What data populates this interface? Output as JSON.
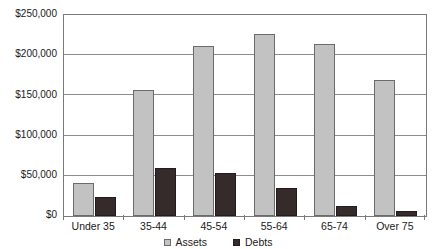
{
  "chart_data": {
    "type": "bar",
    "title": "",
    "subtitle": "",
    "xlabel": "",
    "ylabel": "",
    "categories": [
      "Under 35",
      "35-44",
      "45-54",
      "55-64",
      "65-74",
      "Over 75"
    ],
    "series": [
      {
        "name": "Assets",
        "color": "#c2c2c2",
        "values": [
          41000,
          157000,
          212000,
          227000,
          214000,
          169000
        ]
      },
      {
        "name": "Debts",
        "color": "#352b2b",
        "values": [
          24000,
          60000,
          54000,
          35000,
          13000,
          6000
        ]
      }
    ],
    "ylim": [
      0,
      250000
    ],
    "ytick_values": [
      250000,
      200000,
      150000,
      100000,
      50000,
      0
    ],
    "ytick_labels": [
      "$250,000",
      "$200,000",
      "$150,000",
      "$100,000",
      "$50,000",
      "$0"
    ],
    "grid": true,
    "grid_axis": "y",
    "legend_position": "bottom"
  },
  "legend": {
    "items": [
      {
        "label": "Assets"
      },
      {
        "label": "Debts"
      }
    ]
  }
}
